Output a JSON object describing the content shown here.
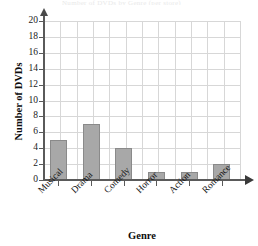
{
  "chart_data": {
    "type": "bar",
    "title": "",
    "categories": [
      "Musical",
      "Drama",
      "Comedy",
      "Horror",
      "Action",
      "Romance"
    ],
    "values": [
      5,
      7,
      4,
      1,
      1,
      2
    ],
    "xlabel": "Genre",
    "ylabel": "Number of DVDs",
    "ylim": [
      0,
      20
    ],
    "ytick_values": [
      0,
      2,
      4,
      6,
      8,
      10,
      12,
      14,
      16,
      18,
      20
    ],
    "ytick_labels": [
      "0",
      "2",
      "4",
      "6",
      "8",
      "10",
      "12",
      "14",
      "16",
      "18",
      "20"
    ],
    "ytick_step": 2,
    "grid": true,
    "grid_color": "#d7d7d7",
    "legend": null,
    "bar_color": "#a8a8a8",
    "bar_border_color": "#8a8a8a",
    "axis_color": "#5a5a5a",
    "xlabel_rotation": -45,
    "axis_arrows": true
  },
  "artifacts": {
    "cropped_title_remnant": "Number of DVDs by Genre (per store)"
  }
}
